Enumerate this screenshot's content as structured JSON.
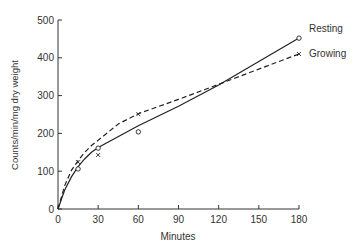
{
  "chart_data": {
    "type": "line",
    "title": "",
    "xlabel": "Minutes",
    "ylabel": "Counts/min/mg dry weight",
    "xlim": [
      0,
      180
    ],
    "ylim": [
      0,
      500
    ],
    "x_ticks": [
      0,
      30,
      60,
      90,
      120,
      150,
      180
    ],
    "y_ticks": [
      0,
      100,
      200,
      300,
      400,
      500
    ],
    "grid": false,
    "legend": "inline labels at line ends (right)",
    "series": [
      {
        "name": "Resting",
        "line_style": "solid",
        "marker": "circle",
        "points": [
          [
            15,
            106
          ],
          [
            30,
            161
          ],
          [
            60,
            204
          ],
          [
            180,
            452
          ]
        ],
        "curve": [
          [
            0,
            0
          ],
          [
            5,
            50
          ],
          [
            10,
            85
          ],
          [
            15,
            112
          ],
          [
            20,
            133
          ],
          [
            25,
            150
          ],
          [
            30,
            163
          ],
          [
            60,
            220
          ],
          [
            90,
            272
          ],
          [
            120,
            328
          ],
          [
            150,
            390
          ],
          [
            180,
            452
          ]
        ]
      },
      {
        "name": "Growing",
        "line_style": "dashed",
        "marker": "x",
        "points": [
          [
            15,
            124
          ],
          [
            30,
            143
          ],
          [
            60,
            251
          ],
          [
            180,
            410
          ]
        ],
        "curve": [
          [
            0,
            0
          ],
          [
            5,
            62
          ],
          [
            10,
            102
          ],
          [
            15,
            128
          ],
          [
            20,
            150
          ],
          [
            25,
            168
          ],
          [
            30,
            182
          ],
          [
            45,
            225
          ],
          [
            60,
            252
          ],
          [
            90,
            290
          ],
          [
            120,
            330
          ],
          [
            150,
            370
          ],
          [
            180,
            410
          ]
        ]
      }
    ]
  }
}
